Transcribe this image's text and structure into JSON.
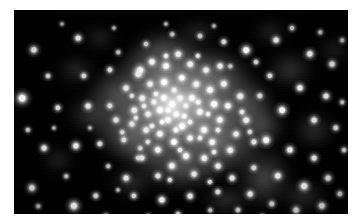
{
  "figure": {
    "kind": "astronomical-image",
    "colors": {
      "page_background": "#ffffff",
      "sky_background": "#000000",
      "star_core": "#ffffff",
      "diffuse_glow": "#b9b9b9",
      "frame_edge": "#020202"
    },
    "frame": {
      "left": 14,
      "top": 10,
      "width": 334,
      "height": 204
    }
  },
  "chart_data": {
    "type": "scatter",
    "title": "",
    "xlabel": "",
    "ylabel": "",
    "xlim": [
      0,
      334
    ],
    "ylim": [
      0,
      204
    ],
    "grid": false,
    "legend": null,
    "colormap": "grayscale",
    "background_value": 0,
    "series": [
      {
        "name": "diffuse-light",
        "type": "blobs",
        "comment": "Smooth unresolved cluster glow and faint nebulosity. x, y, rx, ry, brightness.",
        "blobs": [
          [
            168,
            100,
            92,
            74,
            150
          ],
          [
            163,
            96,
            62,
            52,
            175
          ],
          [
            160,
            94,
            38,
            34,
            196
          ],
          [
            158,
            92,
            22,
            20,
            208
          ],
          [
            150,
            60,
            48,
            32,
            120
          ],
          [
            196,
            70,
            40,
            30,
            118
          ],
          [
            120,
            120,
            44,
            34,
            112
          ],
          [
            206,
            132,
            46,
            36,
            116
          ],
          [
            104,
            86,
            34,
            30,
            96
          ],
          [
            230,
            96,
            34,
            28,
            100
          ],
          [
            168,
            156,
            46,
            28,
            98
          ],
          [
            150,
            40,
            34,
            22,
            84
          ],
          [
            250,
            168,
            30,
            34,
            88
          ],
          [
            78,
            104,
            26,
            22,
            70
          ],
          [
            276,
            60,
            26,
            20,
            62
          ],
          [
            62,
            60,
            20,
            16,
            52
          ],
          [
            300,
            120,
            22,
            20,
            58
          ],
          [
            118,
            172,
            24,
            18,
            56
          ],
          [
            290,
            186,
            24,
            18,
            60
          ],
          [
            212,
            190,
            26,
            16,
            58
          ],
          [
            44,
            150,
            18,
            14,
            44
          ],
          [
            320,
            40,
            18,
            16,
            40
          ],
          [
            86,
            28,
            18,
            14,
            42
          ],
          [
            256,
            22,
            20,
            14,
            44
          ],
          [
            184,
            22,
            22,
            14,
            48
          ],
          [
            248,
            116,
            26,
            22,
            92
          ],
          [
            132,
            134,
            30,
            24,
            94
          ],
          [
            190,
            112,
            30,
            26,
            120
          ]
        ]
      },
      {
        "name": "core-stars",
        "type": "points",
        "comment": "Resolved stars in the dense cluster core. x, y, radius, brightness.",
        "points": [
          [
            158,
            94,
            2.6,
            255
          ],
          [
            150,
            88,
            2.4,
            252
          ],
          [
            166,
            88,
            2.2,
            248
          ],
          [
            146,
            100,
            2.5,
            255
          ],
          [
            162,
            104,
            2.3,
            250
          ],
          [
            172,
            96,
            2.0,
            244
          ],
          [
            154,
            110,
            2.4,
            252
          ],
          [
            140,
            92,
            2.1,
            240
          ],
          [
            178,
            88,
            2.5,
            250
          ],
          [
            134,
            104,
            2.2,
            238
          ],
          [
            168,
            116,
            2.6,
            252
          ],
          [
            186,
            102,
            2.4,
            248
          ],
          [
            128,
            88,
            2.3,
            236
          ],
          [
            190,
            120,
            2.5,
            250
          ],
          [
            146,
            124,
            2.4,
            246
          ],
          [
            176,
            128,
            2.2,
            242
          ],
          [
            120,
            100,
            2.3,
            234
          ],
          [
            200,
            94,
            2.6,
            250
          ],
          [
            206,
            110,
            2.4,
            246
          ],
          [
            160,
            132,
            2.5,
            248
          ],
          [
            132,
            120,
            2.2,
            236
          ],
          [
            198,
            132,
            2.3,
            242
          ],
          [
            118,
            114,
            2.1,
            228
          ],
          [
            214,
            96,
            2.4,
            244
          ],
          [
            150,
            72,
            2.6,
            252
          ],
          [
            168,
            68,
            2.4,
            248
          ],
          [
            182,
            74,
            2.3,
            242
          ],
          [
            136,
            74,
            2.2,
            236
          ],
          [
            196,
            80,
            2.5,
            248
          ],
          [
            124,
            64,
            2.3,
            234
          ],
          [
            210,
            74,
            2.4,
            240
          ],
          [
            152,
            56,
            2.5,
            246
          ],
          [
            176,
            54,
            2.3,
            238
          ],
          [
            192,
            60,
            2.2,
            236
          ],
          [
            138,
            52,
            2.4,
            240
          ],
          [
            206,
            56,
            2.2,
            232
          ],
          [
            164,
            44,
            2.3,
            234
          ],
          [
            144,
            140,
            2.4,
            242
          ],
          [
            172,
            146,
            2.5,
            246
          ],
          [
            190,
            148,
            2.3,
            238
          ],
          [
            158,
            156,
            2.4,
            240
          ],
          [
            204,
            156,
            2.2,
            234
          ],
          [
            128,
            148,
            2.1,
            228
          ],
          [
            216,
            140,
            2.3,
            236
          ],
          [
            110,
            130,
            2.0,
            222
          ],
          [
            222,
            124,
            2.2,
            232
          ],
          [
            232,
            110,
            2.3,
            236
          ],
          [
            102,
            110,
            2.1,
            224
          ],
          [
            112,
            78,
            2.2,
            228
          ],
          [
            226,
            86,
            2.3,
            234
          ],
          [
            240,
            132,
            2.1,
            226
          ],
          [
            96,
            96,
            2.0,
            218
          ],
          [
            180,
            164,
            2.2,
            228
          ],
          [
            144,
            166,
            2.1,
            224
          ],
          [
            218,
            168,
            2.2,
            226
          ],
          [
            162,
            120,
            2.1,
            246
          ],
          [
            154,
            100,
            1.9,
            255
          ],
          [
            170,
            106,
            1.9,
            250
          ],
          [
            148,
            112,
            1.8,
            248
          ],
          [
            176,
            112,
            1.8,
            244
          ],
          [
            142,
            84,
            1.8,
            242
          ],
          [
            184,
            92,
            1.9,
            246
          ],
          [
            130,
            96,
            1.8,
            236
          ],
          [
            194,
            104,
            1.8,
            240
          ],
          [
            160,
            80,
            1.9,
            244
          ],
          [
            138,
            116,
            1.8,
            236
          ],
          [
            186,
            128,
            1.8,
            238
          ],
          [
            122,
            108,
            1.7,
            228
          ],
          [
            204,
            120,
            1.8,
            236
          ],
          [
            166,
            140,
            1.8,
            236
          ],
          [
            134,
            132,
            1.7,
            226
          ],
          [
            200,
            142,
            1.8,
            232
          ],
          [
            152,
            46,
            1.8,
            230
          ],
          [
            184,
            46,
            1.7,
            226
          ],
          [
            118,
            86,
            1.7,
            224
          ],
          [
            228,
            102,
            1.8,
            230
          ],
          [
            108,
            122,
            1.6,
            216
          ],
          [
            236,
            122,
            1.7,
            222
          ],
          [
            156,
            170,
            1.7,
            220
          ],
          [
            196,
            172,
            1.7,
            218
          ],
          [
            126,
            138,
            1.6,
            214
          ]
        ]
      },
      {
        "name": "field-stars",
        "type": "points",
        "comment": "Scattered foreground / halo field stars across the frame. x, y, radius, brightness.",
        "points": [
          [
            8,
            88,
            3.0,
            255
          ],
          [
            20,
            40,
            2.4,
            238
          ],
          [
            64,
            28,
            2.2,
            230
          ],
          [
            44,
            98,
            2.0,
            214
          ],
          [
            74,
            96,
            2.2,
            226
          ],
          [
            30,
            138,
            2.2,
            224
          ],
          [
            62,
            136,
            2.4,
            232
          ],
          [
            86,
            134,
            2.0,
            218
          ],
          [
            18,
            178,
            2.4,
            234
          ],
          [
            60,
            196,
            2.8,
            248
          ],
          [
            82,
            186,
            2.0,
            212
          ],
          [
            42,
            226,
            1.8,
            200
          ],
          [
            112,
            168,
            2.2,
            224
          ],
          [
            124,
            148,
            1.8,
            204
          ],
          [
            96,
            60,
            2.0,
            214
          ],
          [
            126,
            60,
            2.6,
            242
          ],
          [
            120,
            186,
            2.0,
            210
          ],
          [
            148,
            190,
            2.4,
            232
          ],
          [
            176,
            186,
            2.2,
            224
          ],
          [
            204,
            182,
            2.0,
            214
          ],
          [
            70,
            66,
            2.0,
            212
          ],
          [
            34,
            66,
            1.8,
            202
          ],
          [
            14,
            120,
            1.7,
            196
          ],
          [
            24,
            196,
            1.6,
            190
          ],
          [
            92,
            206,
            1.8,
            200
          ],
          [
            134,
            206,
            1.6,
            188
          ],
          [
            164,
            204,
            1.8,
            198
          ],
          [
            196,
            200,
            1.6,
            188
          ],
          [
            232,
            40,
            2.6,
            244
          ],
          [
            262,
            30,
            2.2,
            226
          ],
          [
            296,
            44,
            2.4,
            234
          ],
          [
            318,
            54,
            2.2,
            222
          ],
          [
            256,
            66,
            2.0,
            214
          ],
          [
            286,
            78,
            2.4,
            232
          ],
          [
            312,
            86,
            2.2,
            222
          ],
          [
            268,
            100,
            2.6,
            242
          ],
          [
            246,
            86,
            2.0,
            212
          ],
          [
            300,
            110,
            2.2,
            222
          ],
          [
            322,
            118,
            2.0,
            210
          ],
          [
            252,
            130,
            2.6,
            244
          ],
          [
            276,
            140,
            2.4,
            232
          ],
          [
            300,
            148,
            2.2,
            222
          ],
          [
            240,
            158,
            2.0,
            212
          ],
          [
            264,
            166,
            2.4,
            230
          ],
          [
            290,
            176,
            2.6,
            240
          ],
          [
            314,
            168,
            2.2,
            220
          ],
          [
            236,
            184,
            2.2,
            222
          ],
          [
            258,
            194,
            2.0,
            210
          ],
          [
            282,
            200,
            2.2,
            220
          ],
          [
            308,
            196,
            2.4,
            230
          ],
          [
            326,
            184,
            2.0,
            208
          ],
          [
            224,
            200,
            1.8,
            200
          ],
          [
            248,
            206,
            1.6,
            190
          ],
          [
            272,
            210,
            1.6,
            188
          ],
          [
            210,
            32,
            2.0,
            212
          ],
          [
            186,
            26,
            1.8,
            200
          ],
          [
            158,
            24,
            1.6,
            190
          ],
          [
            132,
            34,
            1.8,
            198
          ],
          [
            104,
            42,
            1.6,
            188
          ],
          [
            278,
            18,
            1.8,
            198
          ],
          [
            306,
            22,
            1.6,
            188
          ],
          [
            328,
            30,
            1.6,
            186
          ],
          [
            330,
            140,
            1.8,
            200
          ],
          [
            328,
            92,
            1.6,
            188
          ],
          [
            242,
            52,
            1.8,
            204
          ],
          [
            216,
            56,
            1.6,
            192
          ],
          [
            94,
            156,
            1.6,
            188
          ],
          [
            52,
            166,
            1.6,
            186
          ],
          [
            104,
            180,
            1.4,
            178
          ],
          [
            76,
            118,
            1.4,
            176
          ],
          [
            40,
            118,
            1.4,
            174
          ],
          [
            152,
            14,
            1.4,
            176
          ],
          [
            200,
            16,
            1.4,
            174
          ],
          [
            100,
            18,
            1.4,
            172
          ],
          [
            48,
            14,
            1.4,
            172
          ]
        ]
      }
    ]
  }
}
